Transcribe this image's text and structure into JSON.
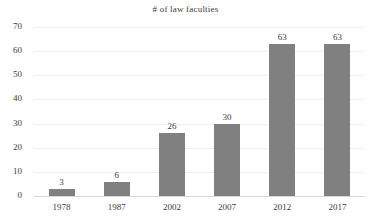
{
  "chart_data": {
    "type": "bar",
    "title": "# of law faculties",
    "xlabel": "",
    "ylabel": "",
    "categories": [
      "1978",
      "1987",
      "2002",
      "2007",
      "2012",
      "2017"
    ],
    "values": [
      3,
      6,
      26,
      30,
      63,
      63
    ],
    "data_labels": [
      "3",
      "6",
      "26",
      "30",
      "63",
      "63"
    ],
    "ylim": [
      0,
      70
    ],
    "ytick_step": 10,
    "yticks": [
      "70",
      "60",
      "50",
      "40",
      "30",
      "20",
      "10",
      "0"
    ],
    "ytick_values": [
      70,
      60,
      50,
      40,
      30,
      20,
      10,
      0
    ],
    "grid": true,
    "grid_axis": "y",
    "legend": false,
    "legend_position": "none",
    "series": [
      {
        "name": "# of law faculties",
        "values": [
          3,
          6,
          26,
          30,
          63,
          63
        ]
      }
    ],
    "colors": {
      "bar": "#808080",
      "gridline": "#efefef",
      "axis": "#d9d9d9",
      "text": "#3c3c3c",
      "background": "#ffffff"
    }
  }
}
